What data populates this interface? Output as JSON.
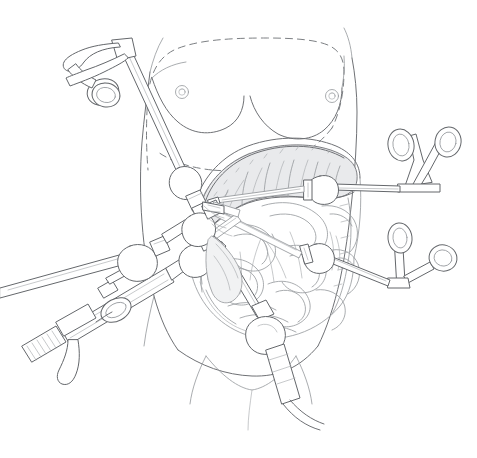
{
  "figure": {
    "title": "Laparoscopic abdominal surgery — instrument port placement",
    "style": "pen-and-ink line drawing",
    "background_color": "#ffffff",
    "line_color": "#6f7175",
    "shadow_color": "#e9eaec",
    "width": 477,
    "height": 458
  },
  "anatomy": {
    "torso": {
      "label": "supine torso outline",
      "parts": [
        "left breast",
        "right breast",
        "left nipple",
        "right nipple",
        "left flank contour",
        "right flank contour",
        "pubic region",
        "left thigh",
        "right thigh"
      ]
    },
    "rib_cage_margin": {
      "label": "costal margin",
      "line_style": "dashed",
      "note": "dashed outline marking the rib cage / costal margin over the upper abdomen"
    },
    "incision_margin": {
      "label": "abdominal wall opening",
      "note": "curved cut edge of the abdominal wall exposing the peritoneal cavity"
    },
    "viscera": [
      {
        "name": "transverse-colon",
        "label": "Transverse colon",
        "note": "broad haustrated loop arcing across the upper abdomen, shaded along its lower border"
      },
      {
        "name": "small-bowel",
        "label": "Small bowel loops",
        "note": "coiled loops of jejunum and ileum filling the central and lower abdomen"
      },
      {
        "name": "ascending-colon",
        "label": "Ascending colon",
        "note": "vertical segment along the patient's right flank"
      },
      {
        "name": "descending-colon",
        "label": "Descending colon",
        "note": "vertical segment along the patient's left flank"
      },
      {
        "name": "mesentery",
        "label": "Mesentery",
        "note": "fan of fine vascular lines between bowel loops"
      }
    ]
  },
  "instruments": [
    {
      "id": "upper-left-grasper",
      "label": "Ring-handled grasping forceps",
      "handle_type": "double finger ring, offset shank",
      "ring_count": 2,
      "entry": "left upper quadrant trocar",
      "direction": "from upper left, angled down and right",
      "has_trocar": true
    },
    {
      "id": "right-lateral-forceps",
      "label": "V-handle ring forceps",
      "handle_type": "V-shaped double finger ring",
      "ring_count": 2,
      "entry": "right mid-abdominal trocar",
      "direction": "horizontal, from the right",
      "has_trocar": true
    },
    {
      "id": "right-lower-forceps",
      "label": "Offset ring forceps",
      "handle_type": "offset double finger ring",
      "ring_count": 2,
      "entry": "right lower quadrant trocar",
      "direction": "from lower right, angled up and left",
      "has_trocar": true
    },
    {
      "id": "laparoscope",
      "label": "Laparoscope with camera head",
      "handle_type": "cylindrical camera body with knurled eyepiece collar and light-post",
      "ring_count": 0,
      "entry": "left lower quadrant trocar",
      "direction": "from lower left, angled up and right",
      "has_trocar": true
    },
    {
      "id": "secondary-left-instrument",
      "label": "Second left-side instrument shaft",
      "handle_type": "straight shaft entering beside the laparoscope",
      "ring_count": 0,
      "entry": "left lower quadrant trocar",
      "direction": "from lower left, angled up and right",
      "has_trocar": true
    },
    {
      "id": "suction-irrigator",
      "label": "Suction / irrigation cannula with flexible tubing",
      "handle_type": "segmented corrugated tubing with trailing flexible tail",
      "ring_count": 0,
      "entry": "suprapubic trocar",
      "direction": "from below, angled up and slightly left",
      "has_trocar": true
    }
  ],
  "trocars": {
    "label": "Trocar cannula / port",
    "count": 6,
    "note": "bulbous valve housing with a collar where each instrument shaft crosses the abdominal wall"
  },
  "labels": {
    "visible_text": [],
    "note": "The illustration contains no printed text, captions, numbers, or legend."
  }
}
